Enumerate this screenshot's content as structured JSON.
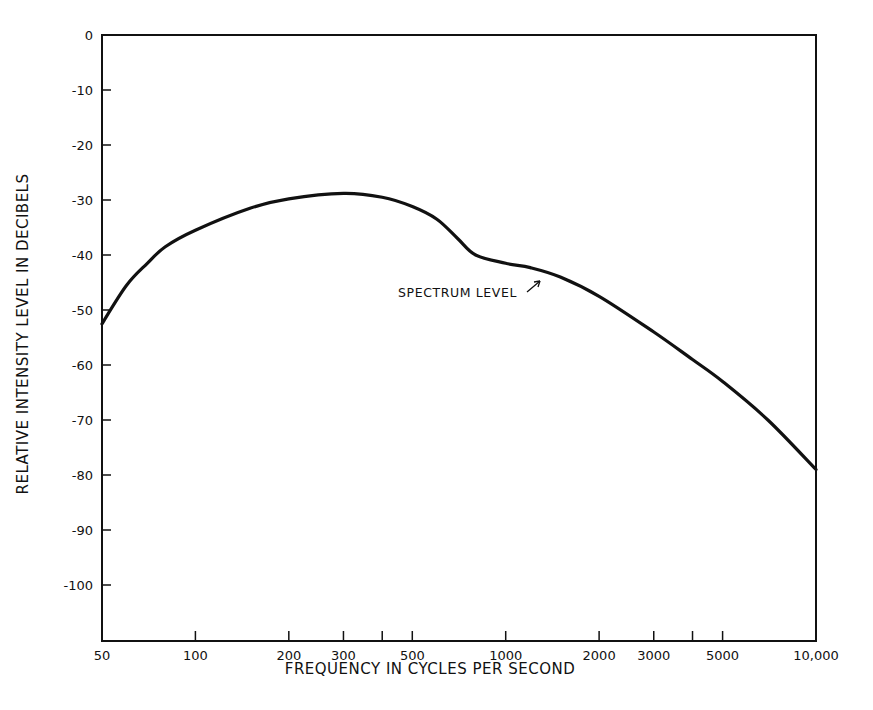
{
  "chart_data": {
    "type": "line",
    "title": "",
    "xlabel": "FREQUENCY IN CYCLES PER SECOND",
    "ylabel": "RELATIVE INTENSITY LEVEL IN DECIBELS",
    "xscale": "log",
    "xlim": [
      50,
      10000
    ],
    "ylim": [
      -110,
      0
    ],
    "grid": false,
    "x_ticks": [
      50,
      100,
      200,
      300,
      400,
      500,
      1000,
      2000,
      3000,
      4000,
      5000,
      10000
    ],
    "x_tick_labels": [
      {
        "value": 50,
        "label": "50"
      },
      {
        "value": 100,
        "label": "100"
      },
      {
        "value": 200,
        "label": "200"
      },
      {
        "value": 300,
        "label": "300"
      },
      {
        "value": 500,
        "label": "500"
      },
      {
        "value": 1000,
        "label": "1000"
      },
      {
        "value": 2000,
        "label": "2000"
      },
      {
        "value": 3000,
        "label": "3000"
      },
      {
        "value": 5000,
        "label": "5000"
      },
      {
        "value": 10000,
        "label": "10,000"
      }
    ],
    "y_ticks": [
      0,
      -10,
      -20,
      -30,
      -40,
      -50,
      -60,
      -70,
      -80,
      -90,
      -100
    ],
    "y_tick_labels": [
      "0",
      "-10",
      "-20",
      "-30",
      "-40",
      "-50",
      "-60",
      "-70",
      "-80",
      "-90",
      "-100"
    ],
    "series": [
      {
        "name": "SPECTRUM LEVEL",
        "x": [
          50,
          60,
          70,
          80,
          100,
          150,
          200,
          300,
          400,
          500,
          600,
          700,
          800,
          1000,
          1200,
          1500,
          2000,
          3000,
          4000,
          5000,
          7000,
          10000
        ],
        "y": [
          -52.5,
          -45.5,
          -41.5,
          -38.5,
          -35.5,
          -31.5,
          -29.8,
          -28.8,
          -29.5,
          -31.2,
          -33.5,
          -37,
          -40,
          -41.5,
          -42.3,
          -44,
          -47.5,
          -54,
          -59,
          -63,
          -70,
          -79
        ]
      }
    ],
    "annotations": [
      {
        "text": "SPECTRUM LEVEL",
        "x": 1500,
        "y": -44,
        "arrow": true
      }
    ]
  }
}
